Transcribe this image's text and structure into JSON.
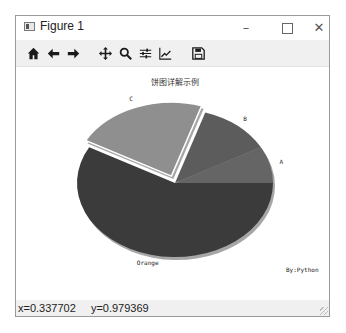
{
  "window": {
    "title": "Figure 1",
    "minimize_glyph": "–",
    "close_glyph": "✕"
  },
  "toolbar": {
    "items": [
      {
        "name": "home-button",
        "icon": "home-icon",
        "label": "Home"
      },
      {
        "name": "back-button",
        "icon": "arrow-left-icon",
        "label": "Back"
      },
      {
        "name": "forward-button",
        "icon": "arrow-right-icon",
        "label": "Forward"
      },
      {
        "name": "pan-button",
        "icon": "move-icon",
        "label": "Pan"
      },
      {
        "name": "zoom-button",
        "icon": "magnifier-icon",
        "label": "Zoom"
      },
      {
        "name": "subplots-button",
        "icon": "sliders-icon",
        "label": "Configure subplots"
      },
      {
        "name": "edit-axis-button",
        "icon": "line-chart-icon",
        "label": "Edit axis"
      },
      {
        "name": "save-button",
        "icon": "floppy-disk-icon",
        "label": "Save"
      }
    ]
  },
  "statusbar": {
    "x": "x=0.337702",
    "y": "y=0.979369"
  },
  "chart_data": {
    "type": "pie",
    "title": "饼图详解示例",
    "labels": [
      "A",
      "B",
      "C",
      "Orange"
    ],
    "values": [
      8,
      12,
      22,
      58
    ],
    "explode": [
      0,
      0,
      0.1,
      0
    ],
    "shadow": true,
    "start_angle": 0,
    "colors": [
      "#656565",
      "#5c5c5c",
      "#8f8f8f",
      "#3b3b3b"
    ],
    "annotation": "By:Python",
    "aspect": "ellipse"
  }
}
